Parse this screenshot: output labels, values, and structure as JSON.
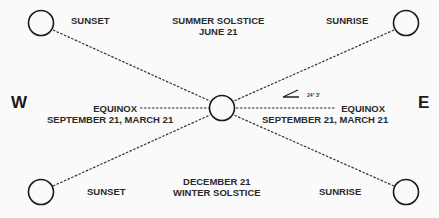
{
  "diagram": {
    "title_top": [
      "SUMMER SOLSTICE",
      "JUNE 21"
    ],
    "title_bottom": [
      "DECEMBER 21",
      "WINTER SOLSTICE"
    ],
    "west_label": "W",
    "east_label": "E",
    "sunset_top": "SUNSET",
    "sunrise_top": "SUNRISE",
    "sunset_bottom": "SUNSET",
    "sunrise_bottom": "SUNRISE",
    "equinox_left": [
      "----- EQUINOX -------------------------",
      "SEPTEMBER 21, MARCH 21"
    ],
    "equinox_right": [
      "---------------------------- EQUINOX -----",
      "SEPTEMBER 21, MARCH 21"
    ],
    "angle": "24° 3'",
    "colors": {
      "line": "#333333",
      "circle": "#1a1a1a",
      "background": "#fafafa"
    }
  }
}
